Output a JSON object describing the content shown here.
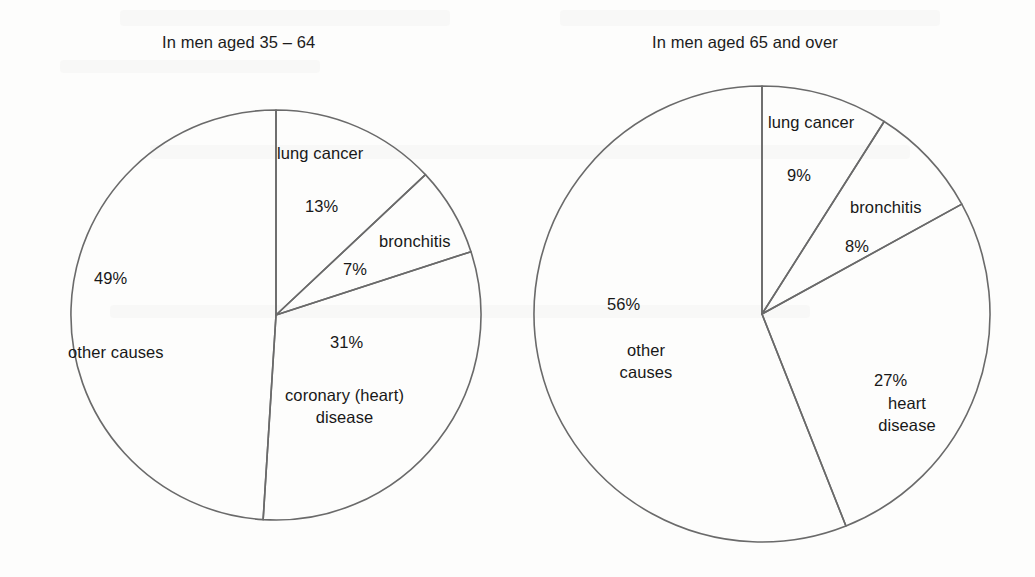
{
  "page": {
    "background_color": "#fdfdfc",
    "line_color": "#6a6a6a",
    "text_color": "#181818"
  },
  "charts": [
    {
      "id": "left",
      "title": "In men aged 35 – 64",
      "center": {
        "x": 276,
        "y": 315
      },
      "radius": 205,
      "slices": [
        {
          "name": "lung cancer",
          "label": "lung cancer",
          "percent": 13,
          "percent_label": "13%"
        },
        {
          "name": "bronchitis",
          "label": "bronchitis",
          "percent": 7,
          "percent_label": "7%"
        },
        {
          "name": "coronary heart disease",
          "label": "coronary (heart)\ndisease",
          "percent": 31,
          "percent_label": "31%"
        },
        {
          "name": "other causes",
          "label": "other causes",
          "percent": 49,
          "percent_label": "49%"
        }
      ]
    },
    {
      "id": "right",
      "title": "In men aged 65 and over",
      "center": {
        "x": 762,
        "y": 314
      },
      "radius": 228,
      "slices": [
        {
          "name": "lung cancer",
          "label": "lung cancer",
          "percent": 9,
          "percent_label": "9%"
        },
        {
          "name": "bronchitis",
          "label": "bronchitis",
          "percent": 8,
          "percent_label": "8%"
        },
        {
          "name": "heart disease",
          "label": "heart\ndisease",
          "percent": 27,
          "percent_label": "27%"
        },
        {
          "name": "other causes",
          "label": "other\ncauses",
          "percent": 56,
          "percent_label": "56%"
        }
      ]
    }
  ],
  "labels": {
    "left": {
      "title": "In men aged 35 – 64",
      "lung_cancer_name": "lung cancer",
      "lung_cancer_pct": "13%",
      "bronchitis_name": "bronchitis",
      "bronchitis_pct": "7%",
      "other_causes_pct": "49%",
      "other_causes_name": "other causes",
      "coronary_pct": "31%",
      "coronary_name_line1": "coronary (heart)",
      "coronary_name_line2": "disease"
    },
    "right": {
      "title": "In men aged 65 and over",
      "lung_cancer_name": "lung cancer",
      "lung_cancer_pct": "9%",
      "bronchitis_name": "bronchitis",
      "bronchitis_pct": "8%",
      "other_causes_pct": "56%",
      "other_causes_name_line1": "other",
      "other_causes_name_line2": "causes",
      "heart_pct": "27%",
      "heart_name_line1": "heart",
      "heart_name_line2": "disease"
    }
  },
  "chart_data": [
    {
      "type": "pie",
      "title": "In men aged 35 – 64",
      "categories": [
        "lung cancer",
        "bronchitis",
        "coronary (heart) disease",
        "other causes"
      ],
      "values": [
        13,
        7,
        31,
        49
      ],
      "value_labels": [
        "13%",
        "7%",
        "31%",
        "49%"
      ],
      "units": "percent",
      "start_angle_deg": -90,
      "direction": "clockwise",
      "legend": "none (labels placed inside slices)",
      "grid": false
    },
    {
      "type": "pie",
      "title": "In men aged 65 and over",
      "categories": [
        "lung cancer",
        "bronchitis",
        "heart disease",
        "other causes"
      ],
      "values": [
        9,
        8,
        27,
        56
      ],
      "value_labels": [
        "9%",
        "8%",
        "27%",
        "56%"
      ],
      "units": "percent",
      "start_angle_deg": -90,
      "direction": "clockwise",
      "legend": "none (labels placed inside slices)",
      "grid": false
    }
  ]
}
